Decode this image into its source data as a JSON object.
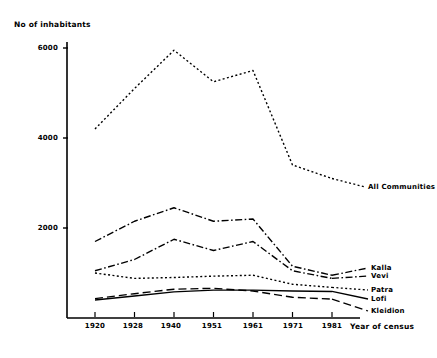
{
  "chart_data": {
    "type": "line",
    "title": "",
    "ylabel": "No of inhabitants",
    "xlabel": "Year of census",
    "categories": [
      "1920",
      "1928",
      "1940",
      "1951",
      "1961",
      "1971",
      "1981"
    ],
    "x": [
      1920,
      1928,
      1940,
      1951,
      1961,
      1971,
      1981
    ],
    "yticks": [
      2000,
      4000,
      6000
    ],
    "ytick_labels": [
      "2000",
      "4000",
      "6000"
    ],
    "ylim": [
      0,
      6400
    ],
    "grid": false,
    "legend_position": "right-inline",
    "series": [
      {
        "name": "All Communities",
        "linestyle": "dotted",
        "values": [
          4200,
          5100,
          5950,
          5250,
          5500,
          3400,
          3100
        ]
      },
      {
        "name": "Kalla",
        "linestyle": "dash-dot",
        "values": [
          1700,
          2150,
          2450,
          2150,
          2200,
          1150,
          950
        ]
      },
      {
        "name": "Vevi",
        "linestyle": "dash-dot",
        "values": [
          1050,
          1300,
          1750,
          1500,
          1700,
          1050,
          880
        ]
      },
      {
        "name": "Patra",
        "linestyle": "dotted",
        "values": [
          1000,
          880,
          900,
          930,
          950,
          750,
          680
        ]
      },
      {
        "name": "Lofi",
        "linestyle": "solid",
        "values": [
          400,
          490,
          580,
          620,
          620,
          600,
          590
        ]
      },
      {
        "name": "Kleidion",
        "linestyle": "long-dash",
        "values": [
          430,
          540,
          640,
          660,
          600,
          460,
          420
        ]
      }
    ]
  },
  "labels": {
    "series_label_all": "All Communities",
    "series_label_kalla": "Kalla",
    "series_label_vevi": "Vevi",
    "series_label_patra": "Patra",
    "series_label_lofi": "Lofi",
    "series_label_kleidion": "Kleidion",
    "ytick_6000": "6000",
    "ytick_4000": "4000",
    "ytick_2000": "2000",
    "xtick_1920": "1920",
    "xtick_1928": "1928",
    "xtick_1940": "1940",
    "xtick_1951": "1951",
    "xtick_1961": "1961",
    "xtick_1971": "1971",
    "xtick_1981": "1981",
    "y_axis_title": "No of inhabitants",
    "x_axis_title": "Year of census"
  },
  "colors": {
    "ink": "#000000",
    "background": "#ffffff"
  }
}
